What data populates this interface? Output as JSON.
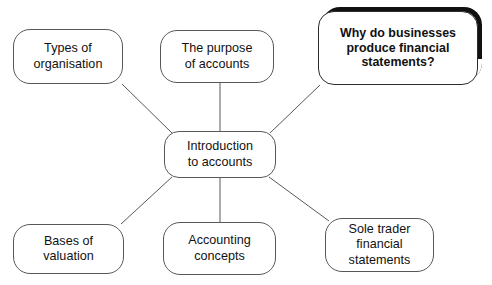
{
  "diagram": {
    "type": "mind-map",
    "background_color": "#ffffff",
    "node_border_color": "#55585c",
    "highlight_color": "#111111",
    "text_color": "#111111",
    "center": {
      "id": "introduction-to-accounts",
      "label": "Introduction\nto accounts",
      "x": 164,
      "y": 131,
      "width": 112,
      "height": 47
    },
    "branches": [
      {
        "id": "types-of-organisation",
        "label": "Types of\norganisation",
        "x": 13,
        "y": 29,
        "width": 110,
        "height": 55,
        "highlighted": false
      },
      {
        "id": "the-purpose-of-accounts",
        "label": "The purpose\nof accounts",
        "x": 160,
        "y": 30,
        "width": 114,
        "height": 53,
        "highlighted": false
      },
      {
        "id": "why-do-businesses-produce-financial-statements",
        "label": "Why do businesses\nproduce financial\nstatements?",
        "x": 318,
        "y": 11,
        "width": 160,
        "height": 74,
        "highlighted": true
      },
      {
        "id": "bases-of-valuation",
        "label": "Bases of\nvaluation",
        "x": 13,
        "y": 224,
        "width": 111,
        "height": 50,
        "highlighted": false
      },
      {
        "id": "accounting-concepts",
        "label": "Accounting\nconcepts",
        "x": 163,
        "y": 222,
        "width": 113,
        "height": 53,
        "highlighted": false
      },
      {
        "id": "sole-trader-financial-statements",
        "label": "Sole trader\nfinancial\nstatements",
        "x": 325,
        "y": 218,
        "width": 109,
        "height": 54,
        "highlighted": false
      }
    ],
    "connectors": [
      {
        "id": "connector-types-of-organisation",
        "x1": 122,
        "y1": 84,
        "x2": 172,
        "y2": 133
      },
      {
        "id": "connector-the-purpose-of-accounts",
        "x1": 220,
        "y1": 83,
        "x2": 220,
        "y2": 131
      },
      {
        "id": "connector-why-do-businesses",
        "x1": 320,
        "y1": 85,
        "x2": 270,
        "y2": 133
      },
      {
        "id": "connector-bases-of-valuation",
        "x1": 172,
        "y1": 177,
        "x2": 121,
        "y2": 224
      },
      {
        "id": "connector-accounting-concepts",
        "x1": 220,
        "y1": 178,
        "x2": 220,
        "y2": 222
      },
      {
        "id": "connector-sole-trader",
        "x1": 269,
        "y1": 177,
        "x2": 329,
        "y2": 221
      }
    ]
  }
}
